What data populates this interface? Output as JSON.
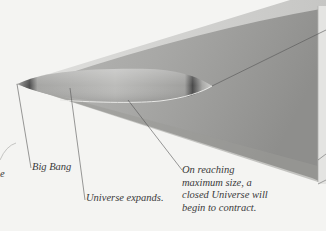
{
  "diagram": {
    "colors": {
      "background": "#f4f4f2",
      "cone_light": "#d8d8d6",
      "cone_dark": "#8e8e8c",
      "ellipse_mid": "#b4b4b2",
      "ellipse_edge_dark": "#555555",
      "leader_line": "#555555",
      "text": "#3a3a3a"
    },
    "labels": {
      "big_bang": "Big Bang",
      "expands": "Universe expands.",
      "contract": "On reaching\nmaximum size, a\nclosed Universe will\nbegin to contract.",
      "edge_fragment": "e"
    }
  }
}
